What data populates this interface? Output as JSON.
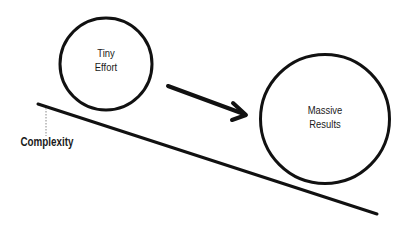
{
  "diagram": {
    "type": "concept-diagram",
    "nodes": [
      {
        "id": "tiny-effort",
        "shape": "circle",
        "label_line1": "Tiny",
        "label_line2": "Effort",
        "size": "small"
      },
      {
        "id": "massive-results",
        "shape": "circle",
        "label_line1": "Massive",
        "label_line2": "Results",
        "size": "large"
      }
    ],
    "edges": [
      {
        "from": "tiny-effort",
        "to": "massive-results",
        "style": "arrow"
      }
    ],
    "slope": {
      "label": "Complexity",
      "direction": "downward-left-to-right"
    },
    "colors": {
      "stroke": "#111111",
      "text": "#1a1a1a",
      "background": "#ffffff",
      "dotted": "#888888"
    }
  }
}
